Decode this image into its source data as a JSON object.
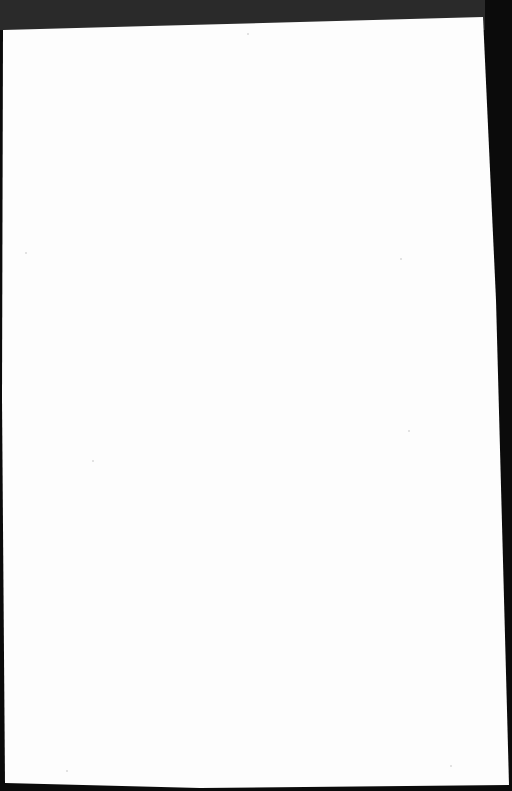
{
  "document": {
    "type": "scanned-page",
    "content": "",
    "colors": {
      "background": "#0b0b0b",
      "page": "#fdfdfd",
      "top_border": "#2a2a2a"
    }
  }
}
